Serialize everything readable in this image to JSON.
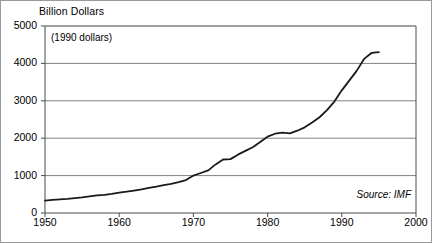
{
  "chart_data": {
    "type": "line",
    "title": "Billion Dollars",
    "note": "(1990 dollars)",
    "source": "Source: IMF",
    "xlabel": "",
    "ylabel": "Billion Dollars",
    "xlim": [
      1950,
      2000
    ],
    "ylim": [
      0,
      5000
    ],
    "xticks": [
      1950,
      1960,
      1970,
      1980,
      1990,
      2000
    ],
    "xtick_labels": [
      "1950",
      "1960",
      "1970",
      "1980",
      "1990",
      "2000"
    ],
    "yticks": [
      0,
      1000,
      2000,
      3000,
      4000,
      5000
    ],
    "ytick_labels": [
      "0",
      "1000",
      "2000",
      "3000",
      "4000",
      "5000"
    ],
    "grid": "horizontal",
    "legend": "none",
    "series": [
      {
        "name": "World trade volume",
        "color": "#1a1a1a",
        "x": [
          1950,
          1951,
          1952,
          1953,
          1954,
          1955,
          1956,
          1957,
          1958,
          1959,
          1960,
          1961,
          1962,
          1963,
          1964,
          1965,
          1966,
          1967,
          1968,
          1969,
          1970,
          1971,
          1972,
          1973,
          1974,
          1975,
          1976,
          1977,
          1978,
          1979,
          1980,
          1981,
          1982,
          1983,
          1984,
          1985,
          1986,
          1987,
          1988,
          1989,
          1990,
          1991,
          1992,
          1993,
          1994,
          1995
        ],
        "values": [
          330,
          350,
          365,
          380,
          400,
          420,
          445,
          470,
          485,
          510,
          545,
          570,
          600,
          630,
          670,
          705,
          745,
          780,
          825,
          880,
          1000,
          1070,
          1140,
          1300,
          1430,
          1440,
          1560,
          1660,
          1760,
          1900,
          2040,
          2120,
          2150,
          2130,
          2200,
          2290,
          2420,
          2560,
          2750,
          2980,
          3280,
          3540,
          3800,
          4120,
          4280,
          4300
        ]
      }
    ]
  },
  "axis": {
    "y_title": "Billion Dollars"
  }
}
